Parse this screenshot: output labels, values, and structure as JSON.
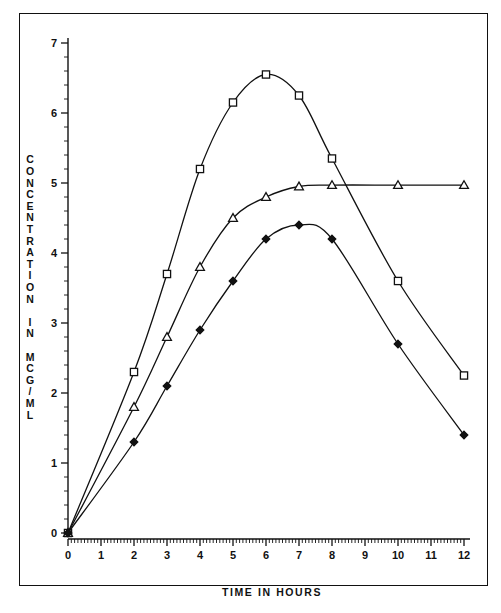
{
  "chart_data": {
    "type": "line",
    "title": "",
    "xlabel": "TIME IN HOURS",
    "ylabel": "CONCENTRATION IN MCG/ML",
    "x": [
      0,
      2,
      3,
      4,
      5,
      6,
      7,
      8,
      10,
      12
    ],
    "xlim": [
      0,
      12
    ],
    "ylim": [
      0,
      7
    ],
    "xticks": [
      "0",
      "1",
      "2",
      "3",
      "4",
      "5",
      "6",
      "7",
      "8",
      "9",
      "10",
      "11",
      "12"
    ],
    "yticks": [
      "0",
      "1",
      "2",
      "3",
      "4",
      "5",
      "6",
      "7"
    ],
    "x_minor_ticks_per_interval": 10,
    "y_minor_ticks_per_interval": 5,
    "grid": false,
    "legend": "none",
    "series": [
      {
        "name": "series-square",
        "marker": "open-square",
        "values": [
          0,
          2.3,
          3.7,
          5.2,
          6.15,
          6.55,
          6.25,
          5.35,
          3.6,
          2.25
        ]
      },
      {
        "name": "series-triangle",
        "marker": "open-triangle",
        "values": [
          0,
          1.8,
          2.8,
          3.8,
          4.5,
          4.8,
          4.95,
          4.97,
          4.97,
          4.97
        ]
      },
      {
        "name": "series-diamond",
        "marker": "filled-diamond",
        "values": [
          0,
          1.3,
          2.1,
          2.9,
          3.6,
          4.2,
          4.4,
          4.2,
          2.7,
          1.4
        ]
      }
    ]
  },
  "axes": {
    "x_title": "TIME IN HOURS",
    "y_title": "CONCENTRATION IN MCG/ML",
    "x_tick_labels": [
      "0",
      "1",
      "2",
      "3",
      "4",
      "5",
      "6",
      "7",
      "8",
      "9",
      "10",
      "11",
      "12"
    ],
    "y_tick_labels": [
      "0",
      "1",
      "2",
      "3",
      "4",
      "5",
      "6",
      "7"
    ]
  }
}
